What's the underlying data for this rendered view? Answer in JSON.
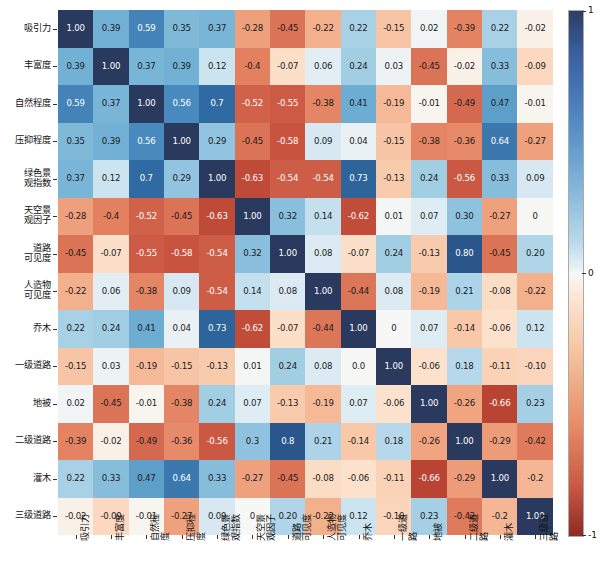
{
  "chart_data": {
    "type": "heatmap",
    "title": "",
    "xlabel": "",
    "ylabel": "",
    "grid": false,
    "legend_position": "right",
    "colormap": "RdBu",
    "colorbar": {
      "ticks": [
        "1",
        "0",
        "-1"
      ],
      "vmin": -1,
      "vmax": 1,
      "min_color": "#8e2a22",
      "mid_color": "#f7f7f5",
      "max_color": "#2c3e63"
    },
    "categories": [
      "吸引力",
      "丰富度",
      "自然程度",
      "压抑程度",
      "绿色景\n观指数",
      "天空景\n观因子",
      "道路\n可见度",
      "人造物\n可见度",
      "乔木",
      "一级道路",
      "地被",
      "二级道路",
      "灌木",
      "三级道路"
    ],
    "row_labels": [
      "吸引力",
      "丰富度",
      "自然程度",
      "压抑程度",
      "绿色景\n观指数",
      "天空景\n观因子",
      "道路\n可见度",
      "人造物\n可见度",
      "乔木",
      "一级道路",
      "地被",
      "二级道路",
      "灌木",
      "三级道路"
    ],
    "col_labels": [
      "吸引力",
      "丰富度",
      "自然程度",
      "压抑程度",
      "绿色景\n观指数",
      "天空景\n观因子",
      "道路\n可见度",
      "人造物\n可见度",
      "乔木",
      "一级道路",
      "地被",
      "二级道路",
      "灌木",
      "三级道路"
    ],
    "values": [
      [
        1.0,
        0.39,
        0.59,
        0.35,
        0.37,
        -0.28,
        -0.45,
        -0.22,
        0.22,
        -0.15,
        0.02,
        -0.39,
        0.22,
        -0.02
      ],
      [
        0.39,
        1.0,
        0.37,
        0.39,
        0.12,
        -0.4,
        -0.07,
        0.06,
        0.24,
        0.03,
        -0.45,
        -0.02,
        0.33,
        -0.09
      ],
      [
        0.59,
        0.37,
        1.0,
        0.56,
        0.7,
        -0.52,
        -0.55,
        -0.38,
        0.41,
        -0.19,
        -0.01,
        -0.49,
        0.47,
        -0.01
      ],
      [
        0.35,
        0.39,
        0.56,
        1.0,
        0.29,
        -0.45,
        -0.58,
        0.09,
        0.04,
        -0.15,
        -0.38,
        -0.36,
        0.64,
        -0.27
      ],
      [
        0.37,
        0.12,
        0.7,
        0.29,
        1.0,
        -0.63,
        -0.54,
        -0.54,
        0.73,
        -0.13,
        0.24,
        -0.56,
        0.33,
        0.09
      ],
      [
        -0.28,
        -0.4,
        -0.52,
        -0.45,
        -0.63,
        1.0,
        0.32,
        0.14,
        -0.62,
        0.01,
        0.07,
        0.3,
        -0.27,
        0.0
      ],
      [
        -0.45,
        -0.07,
        -0.55,
        -0.58,
        -0.54,
        0.32,
        1.0,
        0.08,
        -0.07,
        0.24,
        -0.13,
        0.8,
        -0.45,
        0.2
      ],
      [
        -0.22,
        0.06,
        -0.38,
        0.09,
        -0.54,
        0.14,
        0.08,
        1.0,
        -0.44,
        0.08,
        -0.19,
        0.21,
        -0.08,
        -0.22
      ],
      [
        0.22,
        0.24,
        0.41,
        0.04,
        0.73,
        -0.62,
        -0.07,
        -0.44,
        1.0,
        0.0,
        0.07,
        -0.14,
        -0.06,
        0.12
      ],
      [
        -0.15,
        0.03,
        -0.19,
        -0.15,
        -0.13,
        0.01,
        0.24,
        0.08,
        0.0,
        1.0,
        -0.06,
        0.18,
        -0.11,
        -0.1
      ],
      [
        0.02,
        -0.45,
        -0.01,
        -0.38,
        0.24,
        0.07,
        -0.13,
        -0.19,
        0.07,
        -0.06,
        1.0,
        -0.26,
        -0.66,
        0.23
      ],
      [
        -0.39,
        -0.02,
        -0.49,
        -0.36,
        -0.56,
        0.3,
        0.8,
        0.21,
        -0.14,
        0.18,
        -0.26,
        1.0,
        -0.29,
        -0.42
      ],
      [
        0.22,
        0.33,
        0.47,
        0.64,
        0.33,
        -0.27,
        -0.45,
        -0.08,
        -0.06,
        -0.11,
        -0.66,
        -0.29,
        1.0,
        -0.2
      ],
      [
        -0.02,
        -0.09,
        -0.01,
        -0.27,
        0.09,
        0.0,
        0.2,
        -0.22,
        0.12,
        -0.1,
        0.23,
        -0.42,
        -0.2,
        1.0
      ]
    ],
    "labels": [
      [
        "1.00",
        "0.39",
        "0.59",
        "0.35",
        "0.37",
        "-0.28",
        "-0.45",
        "-0.22",
        "0.22",
        "-0.15",
        "0.02",
        "-0.39",
        "0.22",
        "-0.02"
      ],
      [
        "0.39",
        "1.00",
        "0.37",
        "0.39",
        "0.12",
        "-0.4",
        "-0.07",
        "0.06",
        "0.24",
        "0.03",
        "-0.45",
        "-0.02",
        "0.33",
        "-0.09"
      ],
      [
        "0.59",
        "0.37",
        "1.00",
        "0.56",
        "0.7",
        "-0.52",
        "-0.55",
        "-0.38",
        "0.41",
        "-0.19",
        "-0.01",
        "-0.49",
        "0.47",
        "-0.01"
      ],
      [
        "0.35",
        "0.39",
        "0.56",
        "1.00",
        "0.29",
        "-0.45",
        "-0.58",
        "0.09",
        "0.04",
        "-0.15",
        "-0.38",
        "-0.36",
        "0.64",
        "-0.27"
      ],
      [
        "0.37",
        "0.12",
        "0.7",
        "0.29",
        "1.00",
        "-0.63",
        "-0.54",
        "-0.54",
        "0.73",
        "-0.13",
        "0.24",
        "-0.56",
        "0.33",
        "0.09"
      ],
      [
        "-0.28",
        "-0.4",
        "-0.52",
        "-0.45",
        "-0.63",
        "1.00",
        "0.32",
        "0.14",
        "-0.62",
        "0.01",
        "0.07",
        "0.30",
        "-0.27",
        "0"
      ],
      [
        "-0.45",
        "-0.07",
        "-0.55",
        "-0.58",
        "-0.54",
        "0.32",
        "1.00",
        "0.08",
        "-0.07",
        "0.24",
        "-0.13",
        "0.80",
        "-0.45",
        "0.20"
      ],
      [
        "-0.22",
        "0.06",
        "-0.38",
        "0.09",
        "-0.54",
        "0.14",
        "0.08",
        "1.00",
        "-0.44",
        "0.08",
        "-0.19",
        "0.21",
        "-0.08",
        "-0.22"
      ],
      [
        "0.22",
        "0.24",
        "0.41",
        "0.04",
        "0.73",
        "-0.62",
        "-0.07",
        "-0.44",
        "1.00",
        "0",
        "0.07",
        "-0.14",
        "-0.06",
        "0.12"
      ],
      [
        "-0.15",
        "0.03",
        "-0.19",
        "-0.15",
        "-0.13",
        "0.01",
        "0.24",
        "0.08",
        "0.0",
        "1.00",
        "-0.06",
        "0.18",
        "-0.11",
        "-0.10"
      ],
      [
        "0.02",
        "-0.45",
        "-0.01",
        "-0.38",
        "0.24",
        "0.07",
        "-0.13",
        "-0.19",
        "0.07",
        "-0.06",
        "1.00",
        "-0.26",
        "-0.66",
        "0.23"
      ],
      [
        "-0.39",
        "-0.02",
        "-0.49",
        "-0.36",
        "-0.56",
        "0.3",
        "0.8",
        "0.21",
        "-0.14",
        "0.18",
        "-0.26",
        "1.00",
        "-0.29",
        "-0.42"
      ],
      [
        "0.22",
        "0.33",
        "0.47",
        "0.64",
        "0.33",
        "-0.27",
        "-0.45",
        "-0.08",
        "-0.06",
        "-0.11",
        "-0.66",
        "-0.29",
        "1.00",
        "-0.2"
      ],
      [
        "-0.02",
        "-0.09",
        "-0.01",
        "-0.27",
        "0.09",
        "0",
        "0.20",
        "-0.22",
        "0.12",
        "-0.10",
        "0.23",
        "-0.42",
        "-0.2",
        "1.00"
      ]
    ]
  }
}
